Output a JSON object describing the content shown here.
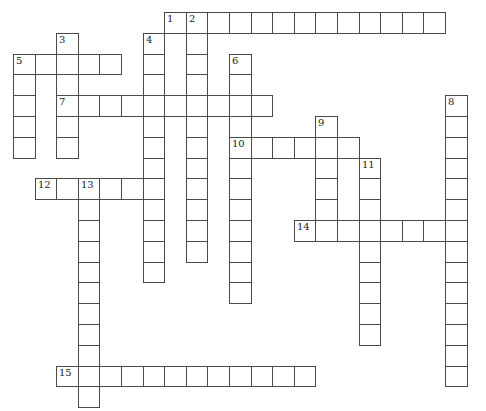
{
  "puzzle": {
    "type": "crossword",
    "cell_width": 21.6,
    "cell_height": 20.8,
    "origin_x": 13,
    "origin_y": 12,
    "entries": [
      {
        "number": 1,
        "direction": "across",
        "row": 0,
        "col": 7,
        "length": 13
      },
      {
        "number": 2,
        "direction": "down",
        "row": 0,
        "col": 8,
        "length": 12
      },
      {
        "number": 3,
        "direction": "down",
        "row": 1,
        "col": 2,
        "length": 6
      },
      {
        "number": 4,
        "direction": "down",
        "row": 1,
        "col": 6,
        "length": 12
      },
      {
        "number": 5,
        "direction": "across",
        "row": 2,
        "col": 0,
        "length": 5
      },
      {
        "number": 5,
        "direction": "down",
        "row": 2,
        "col": 0,
        "length": 5
      },
      {
        "number": 6,
        "direction": "down",
        "row": 2,
        "col": 10,
        "length": 12
      },
      {
        "number": 7,
        "direction": "across",
        "row": 4,
        "col": 2,
        "length": 10
      },
      {
        "number": 8,
        "direction": "down",
        "row": 4,
        "col": 20,
        "length": 14
      },
      {
        "number": 9,
        "direction": "down",
        "row": 5,
        "col": 14,
        "length": 6
      },
      {
        "number": 10,
        "direction": "across",
        "row": 6,
        "col": 10,
        "length": 6
      },
      {
        "number": 11,
        "direction": "down",
        "row": 7,
        "col": 16,
        "length": 9
      },
      {
        "number": 12,
        "direction": "across",
        "row": 8,
        "col": 1,
        "length": 6
      },
      {
        "number": 13,
        "direction": "down",
        "row": 8,
        "col": 3,
        "length": 11
      },
      {
        "number": 14,
        "direction": "across",
        "row": 10,
        "col": 13,
        "length": 8
      },
      {
        "number": 15,
        "direction": "across",
        "row": 17,
        "col": 2,
        "length": 12
      }
    ]
  }
}
